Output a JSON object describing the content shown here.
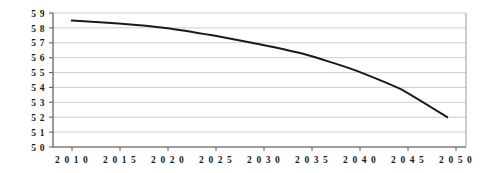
{
  "chart_data": {
    "type": "line",
    "title": "",
    "subtitle": "",
    "xlabel": "",
    "ylabel": "",
    "x": [
      2010,
      2015,
      2020,
      2025,
      2030,
      2035,
      2040,
      2045,
      2050
    ],
    "series": [
      {
        "name": "",
        "values": [
          5.85,
          5.83,
          5.8,
          5.75,
          5.69,
          5.62,
          5.52,
          5.39,
          5.2
        ]
      }
    ],
    "xtick_labels": [
      "2010",
      "2015",
      "2020",
      "2025",
      "2030",
      "2035",
      "2040",
      "2045",
      "2050"
    ],
    "ytick_labels": [
      "5 9",
      "5 8",
      "5 7",
      "5 6",
      "5 5",
      "5 4",
      "5 3",
      "5 2",
      "5 1",
      "5 0"
    ],
    "ytick_values": [
      5.9,
      5.8,
      5.7,
      5.6,
      5.5,
      5.4,
      5.3,
      5.2,
      5.1,
      5.0
    ],
    "xlim": [
      2008,
      2052
    ],
    "ylim": [
      5.0,
      5.9
    ],
    "grid": true,
    "grid_axis": "y",
    "legend": false,
    "legend_position": "none",
    "colors": {
      "line": "#1a1a1a",
      "grid": "#c8c8c8",
      "axis": "#555555",
      "background": "#ffffff",
      "text": "#1a1a1a"
    }
  },
  "geometry": {
    "plot_left": 53,
    "plot_right": 466,
    "plot_top": 13,
    "plot_bottom": 147,
    "tick_positions_x": [
      72,
      120,
      168,
      216,
      264,
      312,
      360,
      408,
      456
    ],
    "tick_positions_y": [
      13,
      27.9,
      42.8,
      57.7,
      72.6,
      87.4,
      102.3,
      117.2,
      132.1,
      147
    ],
    "ylabel_x": 45,
    "xlabel_y": 163,
    "curve_points": [
      [
        72,
        20.4
      ],
      [
        120,
        23.4
      ],
      [
        168,
        27.9
      ],
      [
        216,
        35.3
      ],
      [
        264,
        44.3
      ],
      [
        312,
        54.7
      ],
      [
        360,
        69.6
      ],
      [
        408,
        89.0
      ],
      [
        456,
        117.2
      ]
    ]
  }
}
